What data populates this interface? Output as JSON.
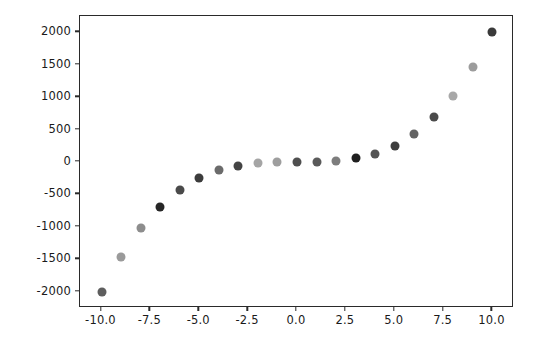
{
  "chart_data": {
    "type": "scatter",
    "title": "",
    "xlabel": "",
    "ylabel": "",
    "xlim": [
      -11.1,
      11.1
    ],
    "ylim": [
      -2250,
      2250
    ],
    "grid": false,
    "legend": null,
    "x": [
      -10,
      -9,
      -8,
      -7,
      -6,
      -5,
      -4,
      -3,
      -2,
      -1,
      0,
      1,
      2,
      3,
      4,
      5,
      6,
      7,
      8,
      9,
      10
    ],
    "y": [
      -2000,
      -1458,
      -1024,
      -686,
      -432,
      -250,
      -128,
      -54,
      -16,
      -2,
      0,
      2,
      16,
      54,
      128,
      250,
      432,
      686,
      1024,
      1458,
      2000
    ],
    "series": [
      {
        "name": "y = 2x^3",
        "marker": "circle",
        "marker_size": 9,
        "points": [
          {
            "x": -10,
            "y": -2000,
            "color": "#5e5e5e"
          },
          {
            "x": -9,
            "y": -1458,
            "color": "#9a9a9a"
          },
          {
            "x": -8,
            "y": -1024,
            "color": "#8d8d8d"
          },
          {
            "x": -7,
            "y": -686,
            "color": "#262626"
          },
          {
            "x": -6,
            "y": -432,
            "color": "#4a4a4a"
          },
          {
            "x": -5,
            "y": -250,
            "color": "#3c3c3c"
          },
          {
            "x": -4,
            "y": -128,
            "color": "#6b6b6b"
          },
          {
            "x": -3,
            "y": -54,
            "color": "#444444"
          },
          {
            "x": -2,
            "y": -16,
            "color": "#a5a5a5"
          },
          {
            "x": -1,
            "y": -2,
            "color": "#9e9e9e"
          },
          {
            "x": 0,
            "y": 0,
            "color": "#4f4f4f"
          },
          {
            "x": 1,
            "y": 2,
            "color": "#5a5a5a"
          },
          {
            "x": 2,
            "y": 16,
            "color": "#7d7d7d"
          },
          {
            "x": 3,
            "y": 54,
            "color": "#1f1f1f"
          },
          {
            "x": 4,
            "y": 128,
            "color": "#545454"
          },
          {
            "x": 5,
            "y": 250,
            "color": "#3e3e3e"
          },
          {
            "x": 6,
            "y": 432,
            "color": "#636363"
          },
          {
            "x": 7,
            "y": 686,
            "color": "#4b4b4b"
          },
          {
            "x": 8,
            "y": 1024,
            "color": "#a8a8a8"
          },
          {
            "x": 9,
            "y": 1458,
            "color": "#9c9c9c"
          },
          {
            "x": 10,
            "y": 2000,
            "color": "#3a3a3a"
          }
        ]
      }
    ],
    "xticks": [
      -10.0,
      -7.5,
      -5.0,
      -2.5,
      0.0,
      2.5,
      5.0,
      7.5,
      10.0
    ],
    "xticklabels": [
      "-10.0",
      "-7.5",
      "-5.0",
      "-2.5",
      "0.0",
      "2.5",
      "5.0",
      "7.5",
      "10.0"
    ],
    "yticks": [
      2000,
      1500,
      1000,
      500,
      0,
      -500,
      -1000,
      -1500,
      -2000
    ],
    "yticklabels": [
      "2000",
      "1500",
      "1000",
      "500",
      "0",
      "-500",
      "-1000",
      "-1500",
      "-2000"
    ],
    "axes_color": "#2a2a2a",
    "background_color": "#ffffff"
  }
}
